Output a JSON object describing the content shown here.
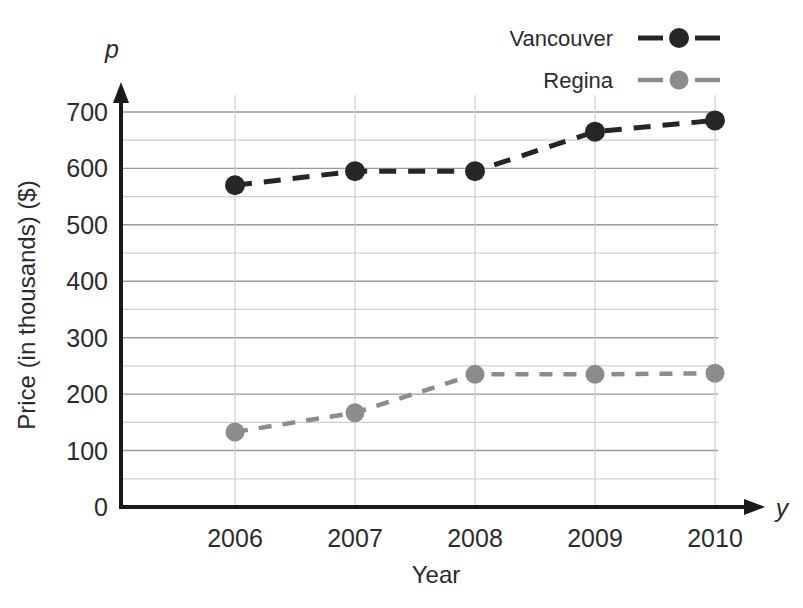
{
  "chart_data": {
    "type": "line",
    "title": "",
    "subtitle": "",
    "xlabel": "Year",
    "ylabel": "Price (in thousands) ($)",
    "x_variable_symbol": "y",
    "y_variable_symbol": "p",
    "categories": [
      "2006",
      "2007",
      "2008",
      "2009",
      "2010"
    ],
    "x": [
      2006,
      2007,
      2008,
      2009,
      2010
    ],
    "xlim": [
      2005.5,
      2010.5
    ],
    "ylim": [
      0,
      730
    ],
    "y_ticks": [
      "0",
      "100",
      "200",
      "300",
      "400",
      "500",
      "600",
      "700"
    ],
    "y_tick_values": [
      0,
      100,
      200,
      300,
      400,
      500,
      600,
      700
    ],
    "y_minor_tick_values": [
      50,
      150,
      250,
      350,
      450,
      550,
      650
    ],
    "grid": "both",
    "legend_position": "top-right",
    "series": [
      {
        "name": "Vancouver",
        "color": "#262626",
        "marker": "circle",
        "linestyle": "dashed",
        "values": [
          570,
          595,
          595,
          665,
          685
        ]
      },
      {
        "name": "Regina",
        "color": "#8c8c8c",
        "marker": "circle",
        "linestyle": "dashed",
        "values": [
          133,
          167,
          235,
          235,
          237
        ]
      }
    ]
  },
  "legend": {
    "items": [
      {
        "label": "Vancouver",
        "color": "#262626"
      },
      {
        "label": "Regina",
        "color": "#8c8c8c"
      }
    ]
  },
  "axes": {
    "y_axis_symbol": "p",
    "x_axis_symbol": "y",
    "y_axis_title": "Price (in thousands) ($)",
    "x_axis_title": "Year"
  },
  "colors": {
    "vancouver": "#262626",
    "regina": "#8c8c8c",
    "axis": "#1a1a1a",
    "grid_major": "#9a9a9a",
    "grid_minor": "#cfcfcf",
    "background": "#ffffff"
  }
}
